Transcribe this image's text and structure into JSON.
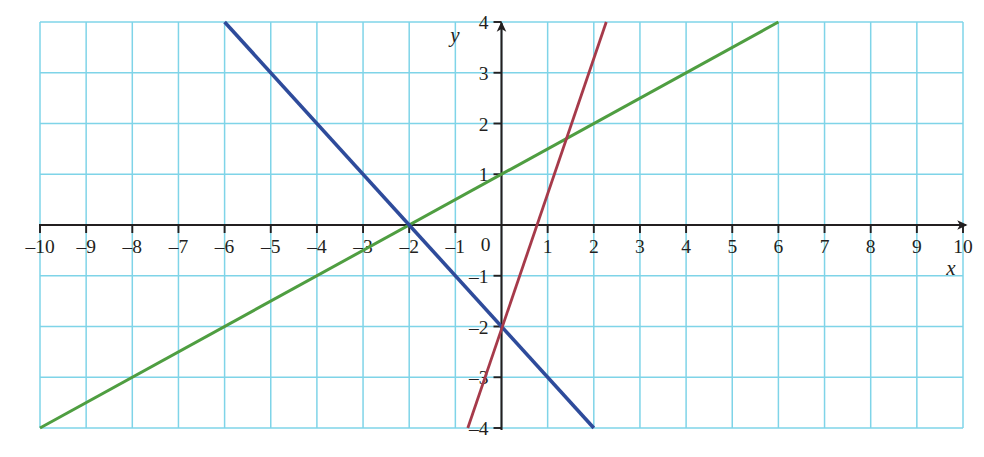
{
  "chart_data": {
    "type": "line",
    "title": "",
    "subtitle": "",
    "xlabel": "x",
    "ylabel": "y",
    "xlim": [
      -10,
      10
    ],
    "ylim": [
      -4,
      4
    ],
    "grid": true,
    "grid_step_x": 1,
    "grid_step_y": 1,
    "grid_color": "#7fd4e8",
    "axis_color": "#231f20",
    "legend": "none",
    "xticks": [
      -10,
      -9,
      -8,
      -7,
      -6,
      -5,
      -4,
      -3,
      -2,
      -1,
      0,
      1,
      2,
      3,
      4,
      5,
      6,
      7,
      8,
      9,
      10
    ],
    "xtick_labels": [
      "–10",
      "–9",
      "–8",
      "–7",
      "–6",
      "–5",
      "–4",
      "–3",
      "–2",
      "–1",
      "0",
      "1",
      "2",
      "3",
      "4",
      "5",
      "6",
      "7",
      "8",
      "9",
      "10"
    ],
    "yticks": [
      -4,
      -3,
      -2,
      -1,
      1,
      2,
      3,
      4
    ],
    "ytick_labels": [
      "–4",
      "–3",
      "–2",
      "–1",
      "1",
      "2",
      "3",
      "4"
    ],
    "origin_label": "0",
    "series": [
      {
        "name": "green-line",
        "color": "#4f9e41",
        "equation": "y = 0.5x + 1",
        "slope": 0.5,
        "intercept": 1,
        "x": [
          -10,
          6
        ],
        "values": [
          -4,
          4
        ],
        "x_intercept": -2,
        "linewidth": 3
      },
      {
        "name": "blue-line",
        "color": "#2e4b9b",
        "equation": "y = –x – 2",
        "slope": -1,
        "intercept": -2,
        "x": [
          -6,
          2
        ],
        "values": [
          4,
          -4
        ],
        "x_intercept": -2,
        "linewidth": 3.6
      },
      {
        "name": "red-line",
        "color": "#a63a4a",
        "equation": "y = 2.2x – 1",
        "slope": 2.2,
        "intercept": -1,
        "x": [
          -0.73,
          2.27
        ],
        "values": [
          -4,
          4
        ],
        "x_intercept": 0.45,
        "linewidth": 2.8
      }
    ],
    "annotations": [
      {
        "label": "common intersection of blue and green lines",
        "x": -2,
        "y": 0
      }
    ]
  },
  "axes": {
    "x_axis_label": "x",
    "y_axis_label": "y"
  }
}
